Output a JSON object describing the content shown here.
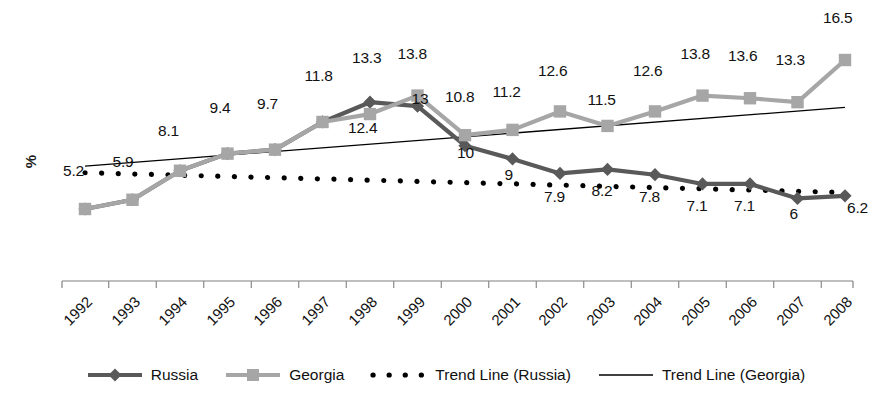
{
  "chart_data": {
    "type": "line",
    "title": "",
    "xlabel": "",
    "ylabel": "%",
    "categories": [
      "1992",
      "1993",
      "1994",
      "1995",
      "1996",
      "1997",
      "1998",
      "1999",
      "2000",
      "2001",
      "2002",
      "2003",
      "2004",
      "2005",
      "2006",
      "2007",
      "2008"
    ],
    "xlim": [
      1992,
      2008
    ],
    "ylim": [
      0,
      17.5
    ],
    "grid": false,
    "legend_position": "bottom",
    "series": [
      {
        "name": "Russia",
        "marker": "diamond",
        "color": "#595959",
        "style": "solid",
        "values": [
          5.2,
          5.9,
          8.1,
          9.4,
          9.7,
          11.8,
          13.3,
          13.0,
          10.0,
          9.0,
          7.9,
          8.2,
          7.8,
          7.1,
          7.1,
          6.0,
          6.2
        ],
        "labels": [
          "5.2",
          "5.9",
          "8.1",
          "9.4",
          "9.7",
          "11.8",
          "13.3",
          "13",
          "10",
          "9",
          "7.9",
          "8.2",
          "7.8",
          "7.1",
          "7.1",
          "6",
          "6.2"
        ]
      },
      {
        "name": "Georgia",
        "marker": "square",
        "color": "#a6a6a6",
        "style": "solid",
        "values": [
          5.2,
          5.9,
          8.1,
          9.4,
          9.7,
          11.8,
          12.4,
          13.8,
          10.8,
          11.2,
          12.6,
          11.5,
          12.6,
          13.8,
          13.6,
          13.3,
          16.5
        ],
        "labels": [
          "",
          "",
          "",
          "",
          "",
          "",
          "12.4",
          "13.8",
          "10.8",
          "11.2",
          "12.6",
          "11.5",
          "12.6",
          "13.8",
          "13.6",
          "13.3",
          "16.5"
        ]
      },
      {
        "name": "Trend Line (Russia)",
        "marker": "none",
        "color": "#000000",
        "style": "dotted",
        "endpoints": [
          [
            1992,
            7.95
          ],
          [
            2008,
            6.45
          ]
        ]
      },
      {
        "name": "Trend Line (Georgia)",
        "marker": "none",
        "color": "#000000",
        "style": "solid",
        "endpoints": [
          [
            1992,
            8.45
          ],
          [
            2008,
            12.9
          ]
        ]
      }
    ],
    "legend": [
      {
        "label": "Russia",
        "swatch": "line-diamond-dark"
      },
      {
        "label": "Georgia",
        "swatch": "line-square-light"
      },
      {
        "label": "Trend Line (Russia)",
        "swatch": "dotted-black"
      },
      {
        "label": "Trend Line (Georgia)",
        "swatch": "solid-thin-black"
      }
    ],
    "colors": {
      "russia": "#595959",
      "georgia": "#a6a6a6",
      "trend": "#000000",
      "axis": "#808080",
      "background": "#ffffff"
    }
  }
}
